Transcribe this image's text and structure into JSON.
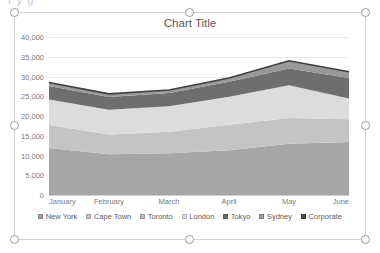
{
  "ghost_text": "r  y   g   ",
  "chart": {
    "title": "Chart Title",
    "selected": true
  },
  "chart_data": {
    "type": "area",
    "stacked": true,
    "title": "Chart Title",
    "xlabel": "",
    "ylabel": "",
    "grid": true,
    "legend_position": "bottom",
    "ylim": [
      0,
      40000
    ],
    "ytick_step": 5000,
    "ytick_labels": [
      "0",
      "5,000",
      "10,000",
      "15,000",
      "20,000",
      "25,000",
      "30,000",
      "35,000",
      "40,000"
    ],
    "yticks": [
      0,
      5000,
      10000,
      15000,
      20000,
      25000,
      30000,
      35000,
      40000
    ],
    "categories": [
      "January",
      "February",
      "March",
      "April",
      "May",
      "June"
    ],
    "series": [
      {
        "name": "New York",
        "color": "#a6a6a6",
        "values": [
          11900,
          10300,
          10600,
          11300,
          13000,
          13400
        ]
      },
      {
        "name": "Cape Town",
        "color": "#c4c4c4",
        "values": [
          5800,
          5000,
          5400,
          6500,
          6500,
          5800
        ]
      },
      {
        "name": "Toronto",
        "color": "#bdbdbd",
        "values": [
          0,
          0,
          0,
          0,
          0,
          0
        ]
      },
      {
        "name": "London",
        "color": "#dcdcdc",
        "values": [
          6500,
          6300,
          6500,
          7100,
          8300,
          5200
        ]
      },
      {
        "name": "Tokyo",
        "color": "#6e6e6e",
        "values": [
          3400,
          3200,
          3300,
          3800,
          4200,
          5200
        ]
      },
      {
        "name": "Sydney",
        "color": "#999999",
        "values": [
          900,
          800,
          800,
          900,
          1800,
          1500
        ]
      },
      {
        "name": "Corporate",
        "color": "#4a4a4a",
        "values": [
          0,
          0,
          0,
          0,
          200,
          100
        ]
      }
    ],
    "totals": [
      28500,
      25600,
      26600,
      29600,
      34000,
      31200
    ]
  },
  "legend": {
    "items": [
      {
        "label": "New York",
        "color": "#a6a6a6"
      },
      {
        "label": "Cape Town",
        "color": "#c4c4c4"
      },
      {
        "label": "Toronto",
        "color": "#bdbdbd"
      },
      {
        "label": "London",
        "color": "#dcdcdc"
      },
      {
        "label": "Tokyo",
        "color": "#6e6e6e"
      },
      {
        "label": "Sydney",
        "color": "#999999"
      },
      {
        "label": "Corporate",
        "color": "#4a4a4a"
      }
    ]
  }
}
